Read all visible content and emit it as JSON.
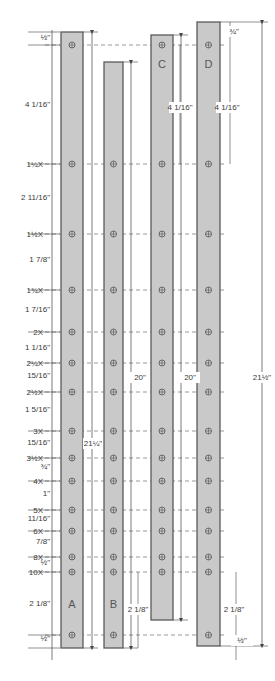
{
  "colors": {
    "strip_fill": "#c9c9c9",
    "strip_stroke": "#5a5a5a",
    "line": "#444444",
    "dash": "#555555"
  },
  "strips": [
    {
      "id": "A",
      "label": "A",
      "x": 61,
      "width": 22,
      "top": 32,
      "bottom": 648,
      "label_y": 608,
      "overall": "21¼\""
    },
    {
      "id": "B",
      "label": "B",
      "x": 104,
      "width": 19,
      "top": 62,
      "bottom": 648,
      "label_y": 608,
      "overall": "20\""
    },
    {
      "id": "C",
      "label": "C",
      "x": 151,
      "width": 22,
      "top": 35,
      "bottom": 620,
      "label_y": 68,
      "overall": "20\""
    },
    {
      "id": "D",
      "label": "D",
      "x": 197,
      "width": 23,
      "top": 22,
      "bottom": 646,
      "label_y": 68,
      "overall": "21½\""
    }
  ],
  "hole_rows": [
    {
      "y": 45,
      "multiplier": ""
    },
    {
      "y": 164,
      "multiplier": "1¼X"
    },
    {
      "y": 234,
      "multiplier": "1½X"
    },
    {
      "y": 290,
      "multiplier": "1¾X"
    },
    {
      "y": 332,
      "multiplier": "2X"
    },
    {
      "y": 363,
      "multiplier": "2¼X"
    },
    {
      "y": 392,
      "multiplier": "2½X"
    },
    {
      "y": 431,
      "multiplier": "3X"
    },
    {
      "y": 458,
      "multiplier": "3½X"
    },
    {
      "y": 481,
      "multiplier": "4X"
    },
    {
      "y": 510,
      "multiplier": "5X"
    },
    {
      "y": 531,
      "multiplier": "6X"
    },
    {
      "y": 557,
      "multiplier": "8X"
    },
    {
      "y": 572,
      "multiplier": "10X"
    },
    {
      "y": 635,
      "multiplier": ""
    }
  ],
  "left_spacings": [
    {
      "text": "½\"",
      "y": 40
    },
    {
      "text": "4 1/16\"",
      "y": 107
    },
    {
      "text": "2 11/16\"",
      "y": 200
    },
    {
      "text": "1 7/8\"",
      "y": 262
    },
    {
      "text": "1 7/16\"",
      "y": 312
    },
    {
      "text": "1 1/16\"",
      "y": 350
    },
    {
      "text": "15/16\"",
      "y": 378
    },
    {
      "text": "1 5/16\"",
      "y": 412
    },
    {
      "text": "15/16\"",
      "y": 445
    },
    {
      "text": "¾\"",
      "y": 469
    },
    {
      "text": "1\"",
      "y": 496
    },
    {
      "text": "11/16\"",
      "y": 521
    },
    {
      "text": "7/8\"",
      "y": 544
    },
    {
      "text": "½\"",
      "y": 565
    },
    {
      "text": "2 1/8\"",
      "y": 606
    },
    {
      "text": "½\"",
      "y": 641
    }
  ],
  "overall_labels": [
    {
      "text": "21¼\"",
      "x": 93,
      "y": 446
    },
    {
      "text": "20\"",
      "x": 140,
      "y": 380
    },
    {
      "text": "20\"",
      "x": 190,
      "y": 380
    },
    {
      "text": "21½\"",
      "x": 262,
      "y": 380
    }
  ],
  "inner_labels": [
    {
      "text": "4 1/16\"",
      "x": 180,
      "y": 110
    },
    {
      "text": "4 1/16\"",
      "x": 227,
      "y": 110
    },
    {
      "text": "¾\"",
      "x": 234,
      "y": 34
    },
    {
      "text": "2 1/8\"",
      "x": 138,
      "y": 612
    },
    {
      "text": "2 1/8\"",
      "x": 234,
      "y": 612
    },
    {
      "text": "½\"",
      "x": 242,
      "y": 643
    }
  ]
}
